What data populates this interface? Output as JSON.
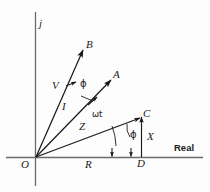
{
  "figure": {
    "background_color": "#fdfdfd",
    "ink_color": "#1a1a1a",
    "width": 210,
    "height": 192
  },
  "axes": {
    "imaginary_label": "j",
    "real_label": "Real",
    "origin_label": "O"
  },
  "vectors": [
    {
      "id": "V",
      "label": "V",
      "tip_label": "B",
      "magnitude_label": "V",
      "description": "voltage phasor to point B"
    },
    {
      "id": "I",
      "label": "I",
      "tip_label": "A",
      "magnitude_label": "I",
      "description": "current phasor to point A"
    },
    {
      "id": "Z",
      "label": "Z",
      "tip_label": "C",
      "magnitude_label": "Z",
      "description": "impedance phasor to point C"
    }
  ],
  "components": {
    "resistance_label": "R",
    "reactance_label": "X",
    "foot_label": "D"
  },
  "angles": {
    "phi_between_V_and_I": "ϕ",
    "phi_at_impedance": "ϕ",
    "rotation_angle": "ωt"
  },
  "labels": {
    "j": "j",
    "real": "Real",
    "O": "O",
    "B": "B",
    "A": "A",
    "C": "C",
    "D": "D",
    "V": "V",
    "I": "I",
    "Z": "Z",
    "R": "R",
    "X": "X",
    "phi_upper": "ϕ",
    "phi_lower": "ϕ",
    "omega_t": "ωt"
  }
}
